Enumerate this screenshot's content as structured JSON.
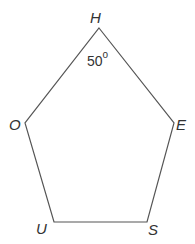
{
  "diagram": {
    "type": "pentagon",
    "stroke_color": "#555555",
    "vertices": [
      {
        "name": "H",
        "x": 99,
        "y": 28,
        "label_x": 90,
        "label_y": 10
      },
      {
        "name": "E",
        "x": 174,
        "y": 123,
        "label_x": 176,
        "label_y": 117
      },
      {
        "name": "S",
        "x": 147,
        "y": 222,
        "label_x": 148,
        "label_y": 222
      },
      {
        "name": "U",
        "x": 54,
        "y": 222,
        "label_x": 36,
        "label_y": 221
      },
      {
        "name": "O",
        "x": 25,
        "y": 123,
        "label_x": 9,
        "label_y": 117
      }
    ],
    "angle_annotation": {
      "vertex": "H",
      "value": "50",
      "unit": "o",
      "x": 87,
      "y": 52
    }
  }
}
